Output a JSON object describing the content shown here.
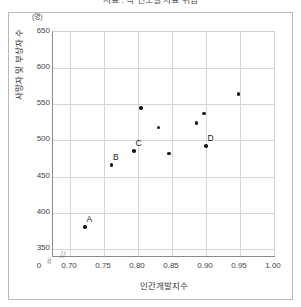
{
  "figure": {
    "title": "자료 : 각 연도별 자료 취합",
    "unit_label": "(명)"
  },
  "chart_data": {
    "type": "scatter",
    "title": "자료 : 각 연도별 자료 취합",
    "xlabel": "인간개발지수",
    "ylabel": "사망자 및 부상자 수",
    "unit": "(명)",
    "xlim": [
      0.675,
      1.0
    ],
    "ylim": [
      340,
      650
    ],
    "xticks": [
      "0.70",
      "0.75",
      "0.80",
      "0.85",
      "0.90",
      "0.95",
      "1.00"
    ],
    "xtick_values": [
      0.7,
      0.75,
      0.8,
      0.85,
      0.9,
      0.95,
      1.0
    ],
    "origin_tick": "0",
    "yticks": [
      "350",
      "400",
      "450",
      "500",
      "550",
      "600",
      "650"
    ],
    "ytick_values": [
      350,
      400,
      450,
      500,
      550,
      600,
      650
    ],
    "grid": true,
    "axis_break_x": true,
    "axis_break_y": true,
    "legend": "none",
    "points": [
      {
        "label": "A",
        "x": 0.722,
        "y": 380
      },
      {
        "label": "B",
        "x": 0.761,
        "y": 466
      },
      {
        "label": "C",
        "x": 0.794,
        "y": 485
      },
      {
        "label": "",
        "x": 0.804,
        "y": 545
      },
      {
        "label": "",
        "x": 0.83,
        "y": 518
      },
      {
        "label": "",
        "x": 0.846,
        "y": 482
      },
      {
        "label": "",
        "x": 0.886,
        "y": 524
      },
      {
        "label": "",
        "x": 0.897,
        "y": 537
      },
      {
        "label": "D",
        "x": 0.9,
        "y": 492
      },
      {
        "label": "",
        "x": 0.948,
        "y": 564
      }
    ]
  }
}
